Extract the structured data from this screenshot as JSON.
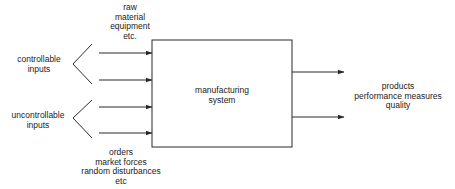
{
  "diagram": {
    "system_box": {
      "label_line1": "manufacturing",
      "label_line2": "system"
    },
    "controllable": {
      "label_line1": "controllable",
      "label_line2": "inputs",
      "examples": [
        "raw",
        "material",
        "equipment",
        "etc."
      ]
    },
    "uncontrollable": {
      "label_line1": "uncontrollable",
      "label_line2": "inputs",
      "examples": [
        "orders",
        "market forces",
        "random disturbances",
        "etc"
      ]
    },
    "outputs": {
      "lines": [
        "products",
        "performance measures",
        "quality"
      ]
    },
    "colors": {
      "line": "#2a2a2a",
      "text": "#222222",
      "background": "#ffffff"
    }
  }
}
